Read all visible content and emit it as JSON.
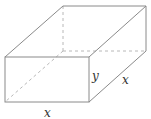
{
  "figure": {
    "type": "rectangular-box-diagram",
    "labels": {
      "height": "y",
      "depth": "x",
      "width": "x"
    },
    "colors": {
      "edge": "#8a8a8a",
      "hidden_edge": "#b8b8b8",
      "label": "#333333"
    }
  }
}
